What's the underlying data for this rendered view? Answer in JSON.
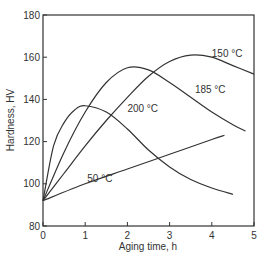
{
  "chart_data": {
    "type": "line",
    "title": "",
    "xlabel": "Aging time, h",
    "ylabel": "Hardness, HV",
    "xlim": [
      0,
      5
    ],
    "ylim": [
      80,
      180
    ],
    "xticks": [
      "0",
      "1",
      "2",
      "3",
      "4",
      "5"
    ],
    "yticks": [
      "80",
      "100",
      "120",
      "140",
      "160",
      "180"
    ],
    "grid": false,
    "legend": "inline curve labels",
    "series": [
      {
        "name": "150 °C",
        "x": [
          0,
          0.5,
          1,
          1.5,
          2,
          2.5,
          3,
          3.5,
          4,
          4.5,
          5
        ],
        "values": [
          92,
          105,
          118,
          130,
          141,
          151,
          158,
          161,
          160,
          156,
          152
        ]
      },
      {
        "name": "185 °C",
        "x": [
          0,
          0.5,
          1,
          1.5,
          2,
          2.5,
          3,
          3.5,
          4,
          4.5,
          4.8
        ],
        "values": [
          92,
          115,
          134,
          148,
          155,
          154,
          148,
          141,
          134,
          128,
          125
        ]
      },
      {
        "name": "200 °C",
        "x": [
          0,
          0.25,
          0.5,
          0.75,
          1,
          1.5,
          2,
          2.5,
          3,
          3.5,
          4,
          4.5
        ],
        "values": [
          92,
          118,
          129,
          135,
          137,
          134,
          126,
          116,
          108,
          102,
          98,
          95
        ]
      },
      {
        "name": "50 °C",
        "x": [
          0,
          1,
          2,
          3,
          4,
          4.3
        ],
        "values": [
          92,
          100,
          107,
          114,
          121,
          123
        ]
      }
    ],
    "annotations": [
      {
        "text": "150 °C",
        "x": 4.0,
        "y": 160
      },
      {
        "text": "185 °C",
        "x": 3.6,
        "y": 143
      },
      {
        "text": "200 °C",
        "x": 2.0,
        "y": 134
      },
      {
        "text": "50 °C",
        "x": 1.05,
        "y": 101
      }
    ]
  }
}
